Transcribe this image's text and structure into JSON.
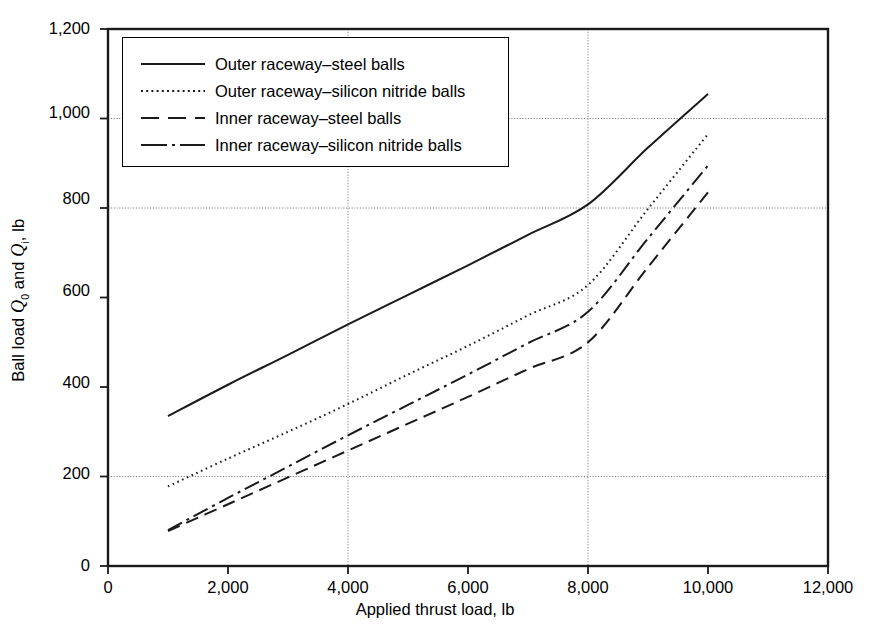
{
  "chart_data": {
    "type": "line",
    "title": "",
    "xlabel": "Applied thrust load, lb",
    "ylabel": "Ball load Q0 and Qi, lb",
    "ylabel_parts": {
      "prefix": "Ball load ",
      "q_outer": "Q",
      "q_outer_sub": "0",
      "middle": " and ",
      "q_inner": "Q",
      "q_inner_sub": "i",
      "suffix": ", lb"
    },
    "xlim": [
      0,
      12000
    ],
    "ylim": [
      0,
      1200
    ],
    "xticks": [
      0,
      2000,
      4000,
      6000,
      8000,
      10000,
      12000
    ],
    "xticklabels": [
      "0",
      "2,000",
      "4,000",
      "6,000",
      "8,000",
      "10,000",
      "12,000"
    ],
    "yticks": [
      0,
      200,
      400,
      600,
      800,
      1000,
      1200
    ],
    "yticklabels": [
      "0",
      "200",
      "400",
      "600",
      "800",
      "1,000",
      "1,200"
    ],
    "grid": "dotted gridlines at y = 200, 800, 1000 and x = 4,000, 8,000",
    "gridlines_y": [
      200,
      800,
      1000
    ],
    "gridlines_x": [
      4000,
      8000
    ],
    "legend_position": "upper left inside axes",
    "line_color": "#1a1a1a",
    "x": [
      1000,
      2000,
      3000,
      4000,
      5000,
      6000,
      7000,
      8000,
      9000,
      10000
    ],
    "series": [
      {
        "name": "Outer raceway–steel balls",
        "dash": "solid",
        "values": [
          335,
          405,
          472,
          540,
          606,
          672,
          740,
          808,
          935,
          1055
        ]
      },
      {
        "name": "Outer raceway–silicon nitride balls",
        "dash": "dotted",
        "values": [
          178,
          240,
          300,
          362,
          428,
          492,
          560,
          628,
          798,
          965
        ]
      },
      {
        "name": "Inner raceway–steel balls",
        "dash": "dashed",
        "values": [
          78,
          138,
          198,
          258,
          318,
          378,
          440,
          500,
          668,
          835
        ]
      },
      {
        "name": "Inner raceway–silicon nitride balls",
        "dash": "dashdot",
        "values": [
          80,
          152,
          222,
          292,
          360,
          428,
          498,
          568,
          732,
          895
        ]
      }
    ]
  },
  "legend": {
    "items": [
      {
        "label": "Outer raceway–steel balls",
        "key": "solid-line-key"
      },
      {
        "label": "Outer raceway–silicon nitride balls",
        "key": "dotted-line-key"
      },
      {
        "label": "Inner raceway–steel balls",
        "key": "dashed-line-key"
      },
      {
        "label": "Inner raceway–silicon nitride balls",
        "key": "dashdot-line-key"
      }
    ]
  },
  "axes": {
    "x_label": "Applied thrust load, lb",
    "x_tick_0": "0",
    "x_tick_1": "2,000",
    "x_tick_2": "4,000",
    "x_tick_3": "6,000",
    "x_tick_4": "8,000",
    "x_tick_5": "10,000",
    "x_tick_6": "12,000",
    "y_tick_0": "0",
    "y_tick_1": "200",
    "y_tick_2": "400",
    "y_tick_3": "600",
    "y_tick_4": "800",
    "y_tick_5": "1,000",
    "y_tick_6": "1,200"
  }
}
